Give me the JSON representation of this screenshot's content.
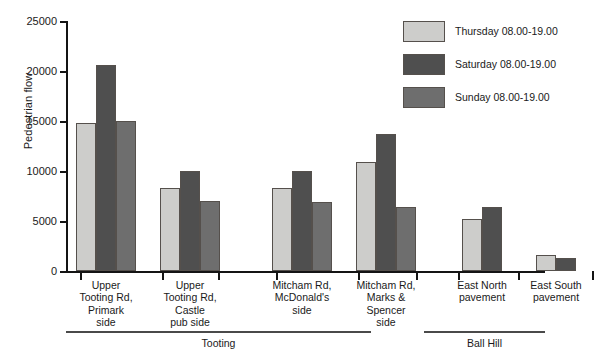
{
  "chart_data": {
    "type": "bar",
    "title": "",
    "xlabel": "",
    "ylabel": "Pedestrian flow",
    "ylim": [
      0,
      25000
    ],
    "ytick_labels": [
      "0",
      "5000",
      "10000",
      "15000",
      "20000",
      "25000"
    ],
    "ytick_values": [
      0,
      5000,
      10000,
      15000,
      20000,
      25000
    ],
    "grid": false,
    "legend_position": "top-right",
    "categories": [
      "Upper Tooting Rd, Primark side",
      "Upper Tooting Rd, Castle pub side",
      "Mitcham Rd, McDonald's side",
      "Mitcham Rd, Marks & Spencer side",
      "East North pavement",
      "East South pavement"
    ],
    "category_lines": [
      [
        "Upper",
        "Tooting Rd,",
        "Primark",
        "side"
      ],
      [
        "Upper",
        "Tooting Rd,",
        "Castle",
        "pub side"
      ],
      [
        "Mitcham Rd,",
        "McDonald's",
        "side"
      ],
      [
        "Mitcham Rd,",
        "Marks & ",
        "Spencer",
        "side"
      ],
      [
        "East North",
        "pavement"
      ],
      [
        "East South",
        "pavement"
      ]
    ],
    "series": [
      {
        "name": "Thursday 08.00-19.00",
        "color": "#cdcdcb",
        "values": [
          14800,
          8300,
          8300,
          10900,
          5200,
          1600
        ]
      },
      {
        "name": "Saturday 08.00-19.00",
        "color": "#4f4f4f",
        "values": [
          20600,
          10000,
          10000,
          13700,
          6400,
          1300
        ]
      },
      {
        "name": "Sunday 08.00-19.00",
        "color": "#6e6e6e",
        "values": [
          15000,
          7000,
          6900,
          6400,
          null,
          null
        ]
      }
    ],
    "super_groups": [
      {
        "label": "Tooting",
        "categories": [
          0,
          1,
          2,
          3
        ]
      },
      {
        "label": "Ball Hill",
        "categories": [
          4,
          5
        ]
      }
    ],
    "annotations": []
  },
  "legend": {
    "items": [
      {
        "label": "Thursday 08.00-19.00",
        "swatch": "#cdcdcb"
      },
      {
        "label": "Saturday 08.00-19.00",
        "swatch": "#4f4f4f"
      },
      {
        "label": "Sunday 08.00-19.00",
        "swatch": "#6e6e6e"
      }
    ]
  }
}
